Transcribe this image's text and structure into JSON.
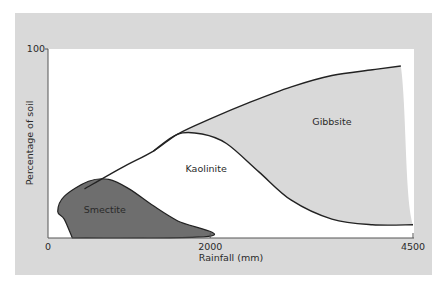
{
  "chart_data": {
    "type": "area",
    "title": "",
    "xlabel": "Rainfall (mm)",
    "ylabel": "Percentage of soil",
    "xlim": [
      0,
      4500
    ],
    "ylim": [
      0,
      100
    ],
    "x_ticks": [
      {
        "value": 0,
        "label": "0"
      },
      {
        "value": 2000,
        "label": "2000"
      },
      {
        "value": 4500,
        "label": "4500"
      }
    ],
    "y_ticks": [
      {
        "value": 100,
        "label": "100"
      }
    ],
    "grid": false,
    "regions": [
      {
        "name": "Smectite",
        "color": "#6e6e6e",
        "boundary": [
          [
            300,
            0
          ],
          [
            200,
            10
          ],
          [
            120,
            14
          ],
          [
            200,
            22
          ],
          [
            500,
            30
          ],
          [
            750,
            31
          ],
          [
            1000,
            26
          ],
          [
            1300,
            17
          ],
          [
            1600,
            9
          ],
          [
            2000,
            1
          ],
          [
            300,
            0
          ]
        ]
      },
      {
        "name": "Kaolinite",
        "color": "#ffffff",
        "upper": [
          [
            450,
            26
          ],
          [
            900,
            37
          ],
          [
            1300,
            46
          ],
          [
            1600,
            55
          ],
          [
            1900,
            55
          ],
          [
            2200,
            50
          ],
          [
            2600,
            35
          ],
          [
            3000,
            20
          ],
          [
            3500,
            10
          ],
          [
            4000,
            7
          ],
          [
            4500,
            7
          ]
        ]
      },
      {
        "name": "Gibbsite",
        "color": "#d9d9d9",
        "upper": [
          [
            1600,
            55
          ],
          [
            2000,
            63
          ],
          [
            2500,
            72
          ],
          [
            3000,
            80
          ],
          [
            3500,
            86
          ],
          [
            4000,
            89
          ],
          [
            4350,
            91
          ]
        ]
      }
    ],
    "annotations": [
      {
        "text": "Smectite",
        "x": 700,
        "y": 13
      },
      {
        "text": "Kaolinite",
        "x": 1950,
        "y": 35
      },
      {
        "text": "Gibbsite",
        "x": 3500,
        "y": 60
      }
    ]
  }
}
